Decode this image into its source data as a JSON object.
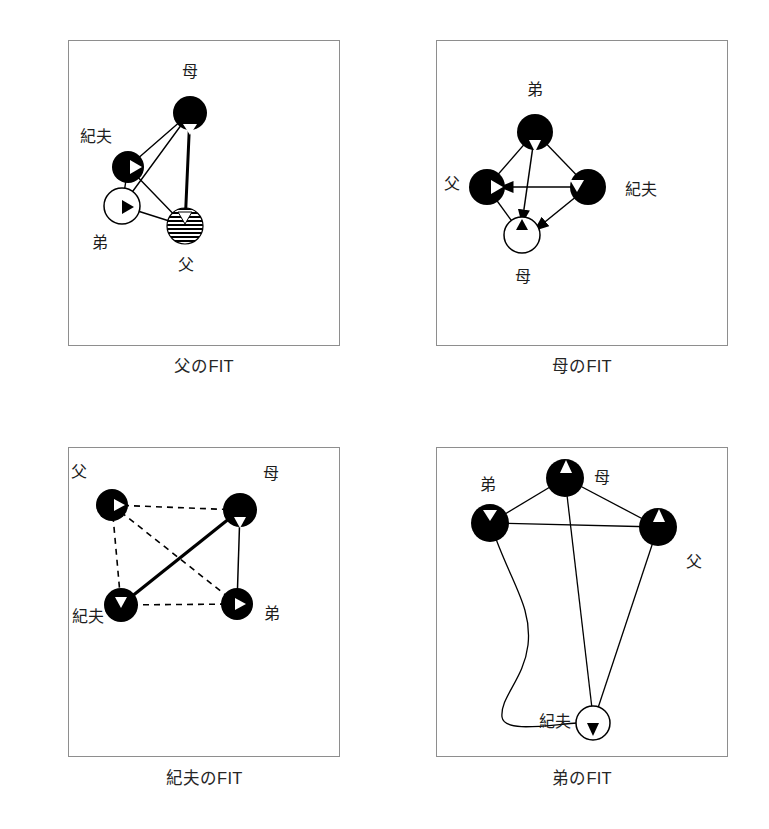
{
  "figure": {
    "type": "sociogram-grid",
    "columns": 2,
    "rows": 2,
    "background_color": "#ffffff",
    "frame_color": "#8e8e8e",
    "ink_color": "#000000"
  },
  "legend_semantics": {
    "node_fill_solid": "#000000",
    "node_fill_hollow": "#ffffff",
    "node_fill_hatched": "horizontal-stripes",
    "edge_styles": [
      "solid-thin",
      "solid-thick",
      "dashed",
      "curved",
      "arrow"
    ]
  },
  "panels": [
    {
      "id": "chichi",
      "caption": "父のFIT",
      "frame": {
        "x": 68,
        "y": 40,
        "w": 272,
        "h": 306
      },
      "nodes": [
        {
          "id": "haha",
          "label": "母",
          "cx": 190,
          "cy": 113,
          "r": 17,
          "fill": "solid",
          "marker": "triangle-down",
          "label_x": 190,
          "label_y": 72
        },
        {
          "id": "norio",
          "label": "紀夫",
          "cx": 128,
          "cy": 167,
          "r": 16,
          "fill": "solid",
          "marker": "triangle-right",
          "label_x": 96,
          "label_y": 137
        },
        {
          "id": "otouto",
          "label": "弟",
          "cx": 122,
          "cy": 206,
          "r": 18,
          "fill": "hollow",
          "marker": "triangle-right-dark",
          "label_x": 100,
          "label_y": 243
        },
        {
          "id": "chichi",
          "label": "父",
          "cx": 185,
          "cy": 226,
          "r": 18,
          "fill": "hatched",
          "marker": "triangle-down",
          "label_x": 186,
          "label_y": 265
        }
      ],
      "edges": [
        {
          "from": "haha",
          "to": "norio",
          "style": "solid",
          "width": 1.4
        },
        {
          "from": "haha",
          "to": "otouto",
          "style": "solid",
          "width": 1.4
        },
        {
          "from": "haha",
          "to": "chichi",
          "style": "solid",
          "width": 3.0
        },
        {
          "from": "norio",
          "to": "chichi",
          "style": "solid",
          "width": 1.4
        },
        {
          "from": "norio",
          "to": "otouto",
          "style": "solid",
          "width": 1.4
        },
        {
          "from": "otouto",
          "to": "chichi",
          "style": "solid",
          "width": 1.4
        }
      ]
    },
    {
      "id": "haha",
      "caption": "母のFIT",
      "frame": {
        "x": 436,
        "y": 40,
        "w": 292,
        "h": 306
      },
      "nodes": [
        {
          "id": "otouto",
          "label": "弟",
          "cx": 535,
          "cy": 132,
          "r": 18,
          "fill": "solid",
          "marker": "triangle-down",
          "label_x": 535,
          "label_y": 90
        },
        {
          "id": "norio",
          "label": "紀夫",
          "cx": 588,
          "cy": 187,
          "r": 18,
          "fill": "solid",
          "marker": "triangle-down-left",
          "label_x": 641,
          "label_y": 190
        },
        {
          "id": "chichi",
          "label": "父",
          "cx": 487,
          "cy": 187,
          "r": 18,
          "fill": "solid",
          "marker": "triangle-right",
          "label_x": 452,
          "label_y": 184
        },
        {
          "id": "haha",
          "label": "母",
          "cx": 522,
          "cy": 235,
          "r": 18,
          "fill": "hollow",
          "marker": "triangle-up-dark",
          "label_x": 523,
          "label_y": 277
        }
      ],
      "edges": [
        {
          "from": "otouto",
          "to": "chichi",
          "style": "solid",
          "width": 1.3
        },
        {
          "from": "otouto",
          "to": "norio",
          "style": "solid",
          "width": 1.3
        },
        {
          "from": "chichi",
          "to": "haha",
          "style": "solid",
          "width": 1.3
        },
        {
          "from": "otouto",
          "to": "haha",
          "style": "arrow",
          "width": 1.5
        },
        {
          "from": "norio",
          "to": "chichi",
          "style": "arrow",
          "width": 1.5
        },
        {
          "from": "norio",
          "to": "haha",
          "style": "arrow",
          "width": 1.5
        }
      ]
    },
    {
      "id": "norio",
      "caption": "紀夫のFIT",
      "frame": {
        "x": 68,
        "y": 447,
        "w": 272,
        "h": 310
      },
      "nodes": [
        {
          "id": "chichi",
          "label": "父",
          "cx": 112,
          "cy": 505,
          "r": 16,
          "fill": "solid",
          "marker": "triangle-right",
          "label_x": 79,
          "label_y": 472
        },
        {
          "id": "haha",
          "label": "母",
          "cx": 240,
          "cy": 510,
          "r": 17,
          "fill": "solid",
          "marker": "triangle-down",
          "label_x": 271,
          "label_y": 474
        },
        {
          "id": "norio",
          "label": "紀夫",
          "cx": 121,
          "cy": 605,
          "r": 17,
          "fill": "solid",
          "marker": "triangle-down-right",
          "label_x": 88,
          "label_y": 617
        },
        {
          "id": "otouto",
          "label": "弟",
          "cx": 237,
          "cy": 604,
          "r": 16,
          "fill": "solid",
          "marker": "triangle-right",
          "label_x": 272,
          "label_y": 614
        }
      ],
      "edges": [
        {
          "from": "chichi",
          "to": "haha",
          "style": "dashed",
          "width": 1.6
        },
        {
          "from": "chichi",
          "to": "norio",
          "style": "dashed",
          "width": 1.6
        },
        {
          "from": "chichi",
          "to": "otouto",
          "style": "dashed",
          "width": 1.6
        },
        {
          "from": "haha",
          "to": "norio",
          "style": "solid",
          "width": 3.2
        },
        {
          "from": "haha",
          "to": "otouto",
          "style": "solid",
          "width": 1.5
        },
        {
          "from": "norio",
          "to": "otouto",
          "style": "dashed",
          "width": 1.6
        }
      ]
    },
    {
      "id": "otouto",
      "caption": "弟のFIT",
      "frame": {
        "x": 436,
        "y": 447,
        "w": 292,
        "h": 310
      },
      "nodes": [
        {
          "id": "haha",
          "label": "母",
          "cx": 565,
          "cy": 478,
          "r": 19,
          "fill": "solid",
          "marker": "triangle-up",
          "label_x": 602,
          "label_y": 478
        },
        {
          "id": "otouto",
          "label": "弟",
          "cx": 490,
          "cy": 523,
          "r": 19,
          "fill": "solid",
          "marker": "triangle-right",
          "label_x": 488,
          "label_y": 485
        },
        {
          "id": "chichi",
          "label": "父",
          "cx": 658,
          "cy": 527,
          "r": 19,
          "fill": "solid",
          "marker": "triangle-up",
          "label_x": 694,
          "label_y": 562
        },
        {
          "id": "norio",
          "label": "紀夫",
          "cx": 593,
          "cy": 723,
          "r": 17,
          "fill": "hollow",
          "marker": "triangle-down-dark",
          "label_x": 555,
          "label_y": 722
        }
      ],
      "edges": [
        {
          "from": "haha",
          "to": "otouto",
          "style": "solid",
          "width": 1.3
        },
        {
          "from": "haha",
          "to": "chichi",
          "style": "solid",
          "width": 1.3
        },
        {
          "from": "haha",
          "to": "norio",
          "style": "solid",
          "width": 1.3
        },
        {
          "from": "otouto",
          "to": "chichi",
          "style": "solid",
          "width": 1.3
        },
        {
          "from": "chichi",
          "to": "norio",
          "style": "solid",
          "width": 1.3
        },
        {
          "from": "otouto",
          "to": "norio",
          "style": "curved",
          "width": 1.3
        }
      ]
    }
  ]
}
